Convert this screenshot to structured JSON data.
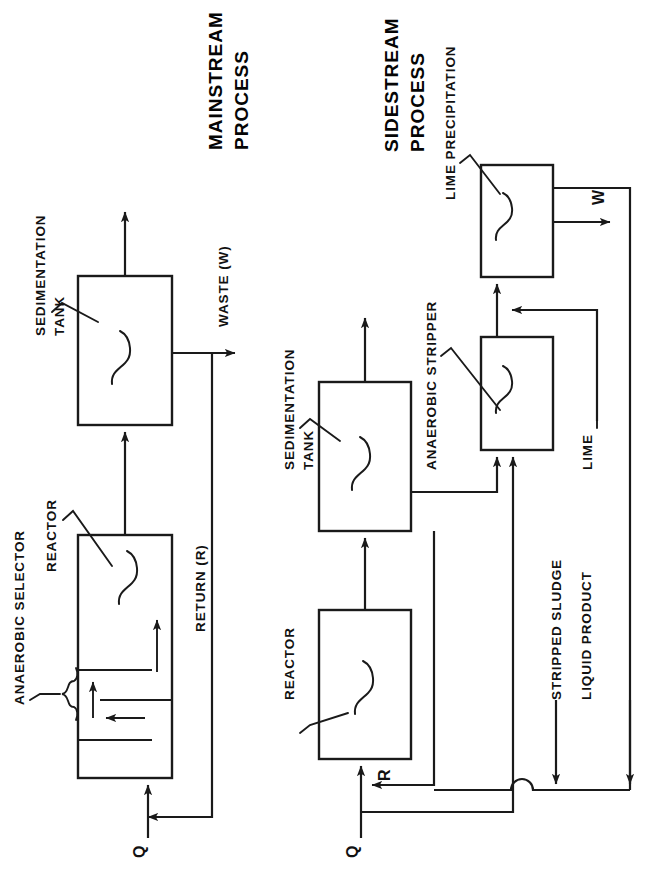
{
  "diagram": {
    "kind": "process-flow-diagram",
    "orientation": "rotated-90-ccw",
    "page_width": 663,
    "page_height": 883,
    "ink_color": "#1a1a1a",
    "background": "#ffffff",
    "sections": [
      {
        "id": "mainstream",
        "title": "MAINSTREAM\nPROCESS",
        "title_line1": "MAINSTREAM",
        "title_line2": "PROCESS"
      },
      {
        "id": "sidestream",
        "title": "SIDESTREAM\nPROCESS",
        "title_line1": "SIDESTREAM",
        "title_line2": "PROCESS"
      }
    ]
  },
  "mainstream": {
    "title_line1": "MAINSTREAM",
    "title_line2": "PROCESS",
    "units": [
      {
        "id": "sedimentation-tank",
        "label_line1": "SEDIMENTATION",
        "label_line2": "TANK"
      },
      {
        "id": "reactor",
        "label": "REACTOR"
      },
      {
        "id": "anaerobic-selector",
        "label": "ANAEROBIC SELECTOR"
      }
    ],
    "streams": [
      {
        "id": "influent",
        "label": "Q"
      },
      {
        "id": "return",
        "label": "RETURN (R)"
      },
      {
        "id": "waste",
        "label": "WASTE (W)"
      },
      {
        "id": "effluent",
        "label": ""
      }
    ]
  },
  "sidestream": {
    "title_line1": "SIDESTREAM",
    "title_line2": "PROCESS",
    "units": [
      {
        "id": "reactor",
        "label": "REACTOR"
      },
      {
        "id": "sedimentation-tank",
        "label_line1": "SEDIMENTATION",
        "label_line2": "TANK"
      },
      {
        "id": "anaerobic-stripper",
        "label": "ANAEROBIC STRIPPER"
      },
      {
        "id": "lime-precipitation",
        "label": "LIME PRECIPITATION"
      }
    ],
    "streams": [
      {
        "id": "influent",
        "label": "Q"
      },
      {
        "id": "return",
        "label": "R"
      },
      {
        "id": "stripped-sludge",
        "label": "STRIPPED SLUDGE"
      },
      {
        "id": "liquid-product",
        "label": "LIQUID PRODUCT"
      },
      {
        "id": "lime-feed",
        "label": "LIME"
      },
      {
        "id": "waste",
        "label": "W"
      }
    ]
  }
}
